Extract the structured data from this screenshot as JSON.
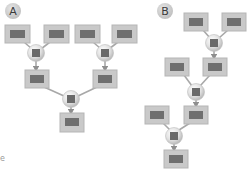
{
  "colors": {
    "box_outer": "#c9c9c9",
    "box_border": "#b5b5b5",
    "box_inner": "#6f6f6f",
    "hub_fill": "#e4e4e4",
    "hub_inner": "#6a6a6a",
    "edge": "#a8a8a8",
    "badge_fill": "#d2d2d2",
    "badge_text": "#3a3a3a"
  },
  "diagram_a": {
    "badge": "A",
    "structure": "balanced binary merge tree: 4 leaves -> 2 hubs -> 2 intermediate nodes -> 1 root hub -> 1 output"
  },
  "diagram_b": {
    "badge": "B",
    "structure": "sequential (linear) merge chain: 2 leaves -> hub -> node; node + leaf -> hub -> node; node + leaf -> hub -> output"
  },
  "edge_fragment": "e"
}
